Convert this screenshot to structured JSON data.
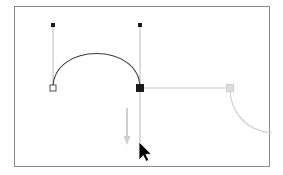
{
  "app": {
    "name": "vector-path-editor-canvas",
    "view_title": "Bezier pen tool editing canvas"
  },
  "canvas": {
    "frame": {
      "x": 14,
      "y": 6,
      "width": 256,
      "height": 161,
      "border_color": "#8a8a8a",
      "background_color": "#ffffff"
    }
  },
  "colors": {
    "path_stroke": "#3b3b3b",
    "handle_line": "#b8b8b8",
    "anchor_fill_selected": "#1a1a1a",
    "anchor_fill_unselected": "#ffffff",
    "anchor_stroke": "#4a4a4a",
    "ghost_path": "#d0d0d0",
    "ghost_handle": "#cfcfcf",
    "drag_arrow": "#cccccc",
    "cursor": "#000000"
  },
  "path": {
    "name": "arch-bezier-path",
    "d": "M 53 88 C 53 42, 140 42, 140 88",
    "stroke_width": 1.1
  },
  "ghost_path": {
    "name": "ghost-curve-path",
    "d": "M 230 88 C 230 112, 246 131, 272 133",
    "stroke_width": 1.2
  },
  "anchors": [
    {
      "name": "anchor-point-start",
      "x": 53,
      "y": 88,
      "size": 6,
      "state": "unselected",
      "shape": "square"
    },
    {
      "name": "anchor-point-end",
      "x": 140,
      "y": 88,
      "size": 7,
      "state": "selected",
      "shape": "square"
    }
  ],
  "control_handles": [
    {
      "name": "control-handle-start-up",
      "anchor_x": 53,
      "anchor_y": 88,
      "handle_x": 53,
      "handle_y": 25,
      "dot_size": 4,
      "dot_shape": "square",
      "dot_fill": "#1a1a1a"
    },
    {
      "name": "control-handle-end-up",
      "anchor_x": 140,
      "anchor_y": 88,
      "handle_x": 140,
      "handle_y": 25,
      "dot_size": 4,
      "dot_shape": "square",
      "dot_fill": "#1a1a1a"
    },
    {
      "name": "control-handle-end-down",
      "anchor_x": 140,
      "anchor_y": 88,
      "handle_x": 140,
      "handle_y": 152,
      "dot_size": 0,
      "dot_shape": "none",
      "dot_fill": "none"
    },
    {
      "name": "control-handle-end-right",
      "anchor_x": 140,
      "anchor_y": 88,
      "handle_x": 230,
      "handle_y": 88,
      "dot_size": 0,
      "dot_shape": "none",
      "dot_fill": "none"
    }
  ],
  "ghost_handle": {
    "name": "ghost-handle-square",
    "x": 230,
    "y": 88,
    "size": 7,
    "fill": "#dedede",
    "stroke": "#cfcfcf"
  },
  "drag_arrow": {
    "name": "drag-direction-arrow-down",
    "x": 127,
    "y_start": 108,
    "y_end": 145,
    "color": "#cfcfcf",
    "direction": "down"
  },
  "cursor": {
    "name": "mouse-pointer-cursor",
    "tip_x": 139,
    "tip_y": 142,
    "color": "#000000"
  }
}
